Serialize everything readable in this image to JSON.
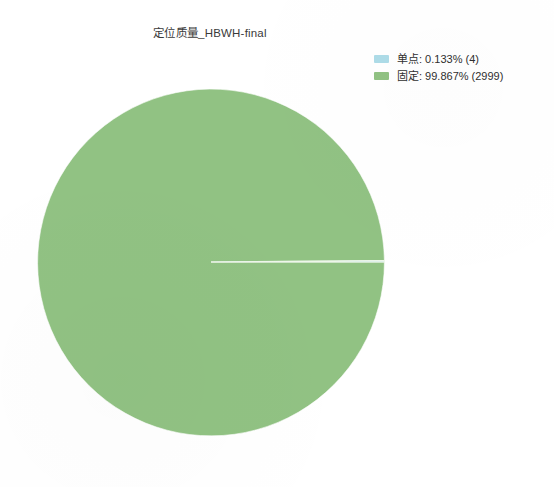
{
  "chart_data": {
    "type": "pie",
    "title": "定位质量_HBWH-final",
    "categories": [
      "单点",
      "固定"
    ],
    "values": [
      4,
      2999
    ],
    "percents": [
      0.133,
      99.867
    ],
    "total": 3003,
    "colors": [
      "#aedce8",
      "#91c283"
    ],
    "legend_position": "top-right",
    "start_angle_deg": 0,
    "direction": "counterclockwise",
    "labels": [
      "单点: 0.133% (4)",
      "固定: 99.867% (2999)"
    ],
    "xlabel": "",
    "ylabel": "",
    "grid": false
  },
  "figure": {
    "background": "#ffffff",
    "title": "定位质量_HBWH-final",
    "pie_fill": "#8fc080",
    "pie_edge": "#ffffff",
    "sliver_color": "#d9ead3"
  },
  "legend": {
    "entries": [
      {
        "swatch": "#aedce8",
        "label": "单点: 0.133% (4)"
      },
      {
        "swatch": "#91c283",
        "label": "固定: 99.867% (2999)"
      }
    ]
  }
}
